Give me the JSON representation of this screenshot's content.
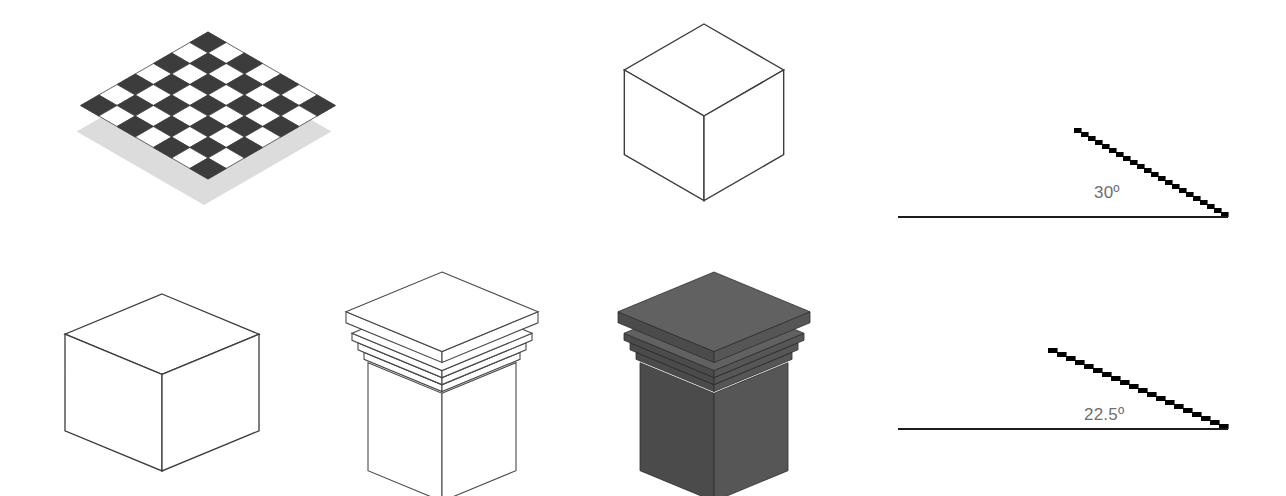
{
  "figure": {
    "background_color": "#ffffff",
    "width": 1286,
    "height": 496
  },
  "palette": {
    "outline": "#3c3c3c",
    "dark_square": "#3c3c3c",
    "light_square": "#ffffff",
    "shadow": "#dcdcdc",
    "solid_fill": "#565656",
    "solid_fill_light": "#616161",
    "solid_fill_dark": "#4b4b4b",
    "step_black": "#000000",
    "baseline": "#1c1c1c",
    "label_gray": "#6e6e6e"
  },
  "panels": [
    {
      "id": "checkerboard",
      "name": "isometric-checkerboard",
      "kind": "checkerboard",
      "rows": 7,
      "cols": 7,
      "has_shadow": true,
      "projection_angle_deg": 30
    },
    {
      "id": "cube-iso",
      "name": "isometric-cube-wireframe",
      "kind": "cube-wireframe",
      "projection_angle_deg": 30
    },
    {
      "id": "angle-30",
      "name": "angle-diagram-30",
      "kind": "angle-diagram",
      "angle_label": "30º",
      "angle_value": 30,
      "step_run": 7,
      "step_rise": 4,
      "steps": 22
    },
    {
      "id": "cube-flat",
      "name": "dimetric-cube-wireframe",
      "kind": "cube-wireframe",
      "projection_angle_deg": 22.5
    },
    {
      "id": "pedestal-wire",
      "name": "pedestal-wireframe",
      "kind": "pedestal-wireframe",
      "projection_angle_deg": 22.5,
      "moulding_bands": 3
    },
    {
      "id": "pedestal-solid",
      "name": "pedestal-shaded",
      "kind": "pedestal-shaded",
      "projection_angle_deg": 22.5,
      "moulding_bands": 3
    },
    {
      "id": "angle-225",
      "name": "angle-diagram-22-5",
      "kind": "angle-diagram",
      "angle_label": "22.5º",
      "angle_value": 22.5,
      "step_run": 9,
      "step_rise": 4,
      "steps": 20
    }
  ],
  "labels": {
    "angle_30": "30º",
    "angle_22_5": "22.5º"
  }
}
